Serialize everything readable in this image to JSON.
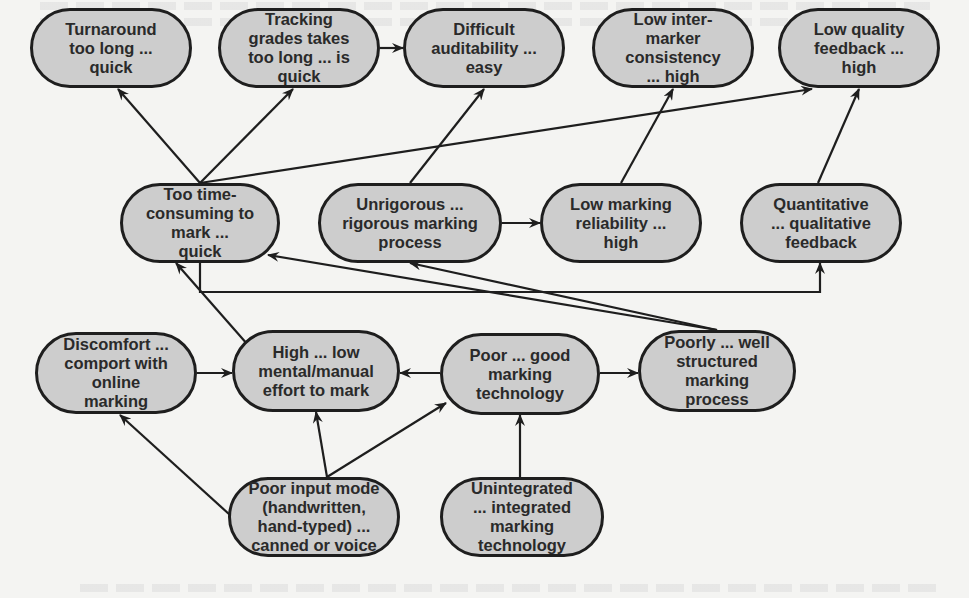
{
  "diagram": {
    "type": "causal-map",
    "colors": {
      "node_fill": "#cdcdcd",
      "node_border": "#1e1e1e",
      "edge": "#1e1e1e",
      "background": "#f4f4f2"
    },
    "nodes": [
      {
        "id": "turnaround",
        "label": "Turnaround\ntoo long ...\nquick",
        "x": 30,
        "y": 8,
        "w": 162,
        "h": 80
      },
      {
        "id": "tracking",
        "label": "Tracking\ngrades takes\ntoo long ...  is\nquick",
        "x": 218,
        "y": 8,
        "w": 162,
        "h": 80
      },
      {
        "id": "auditability",
        "label": "Difficult\nauditability ...\neasy",
        "x": 403,
        "y": 8,
        "w": 162,
        "h": 80
      },
      {
        "id": "consistency",
        "label": "Low inter-\nmarker\nconsistency\n... high",
        "x": 592,
        "y": 8,
        "w": 162,
        "h": 80
      },
      {
        "id": "quality",
        "label": "Low quality\nfeedback ...\nhigh",
        "x": 778,
        "y": 8,
        "w": 162,
        "h": 80
      },
      {
        "id": "timeconsuming",
        "label": "Too time-\nconsuming to\nmark ...\nquick",
        "x": 120,
        "y": 183,
        "w": 160,
        "h": 80
      },
      {
        "id": "unrigorous",
        "label": "Unrigorous ...\nrigorous marking\nprocess",
        "x": 318,
        "y": 183,
        "w": 184,
        "h": 80
      },
      {
        "id": "reliability",
        "label": "Low marking\nreliability ...\nhigh",
        "x": 540,
        "y": 183,
        "w": 162,
        "h": 80
      },
      {
        "id": "quantitative",
        "label": "Quantitative\n... qualitative\nfeedback",
        "x": 740,
        "y": 183,
        "w": 162,
        "h": 80
      },
      {
        "id": "discomfort",
        "label": "Discomfort ...\ncomport with\nonline\nmarking",
        "x": 35,
        "y": 332,
        "w": 162,
        "h": 82
      },
      {
        "id": "effort",
        "label": "High ... low\nmental/manual\neffort to mark",
        "x": 232,
        "y": 330,
        "w": 168,
        "h": 82
      },
      {
        "id": "technology",
        "label": "Poor ... good\nmarking\ntechnology",
        "x": 440,
        "y": 333,
        "w": 160,
        "h": 82
      },
      {
        "id": "structured",
        "label": "Poorly ... well\nstructured\nmarking\nprocess",
        "x": 638,
        "y": 330,
        "w": 158,
        "h": 82
      },
      {
        "id": "inputmode",
        "label": "Poor input mode\n(handwritten,\nhand-typed) ...\ncanned or voice",
        "x": 228,
        "y": 477,
        "w": 172,
        "h": 80
      },
      {
        "id": "unintegrated",
        "label": "Unintegrated\n... integrated\nmarking\ntechnology",
        "x": 440,
        "y": 477,
        "w": 164,
        "h": 80
      }
    ],
    "edges": [
      {
        "from": "timeconsuming",
        "to": "turnaround",
        "points": [
          [
            200,
            183
          ],
          [
            118,
            89
          ]
        ]
      },
      {
        "from": "timeconsuming",
        "to": "tracking",
        "points": [
          [
            200,
            183
          ],
          [
            293,
            89
          ]
        ]
      },
      {
        "from": "timeconsuming",
        "to": "quality",
        "points": [
          [
            200,
            183
          ],
          [
            812,
            89
          ]
        ]
      },
      {
        "from": "tracking",
        "to": "auditability",
        "points": [
          [
            380,
            48
          ],
          [
            403,
            48
          ]
        ]
      },
      {
        "from": "unrigorous",
        "to": "auditability",
        "points": [
          [
            410,
            183
          ],
          [
            484,
            89
          ]
        ]
      },
      {
        "from": "unrigorous",
        "to": "reliability",
        "points": [
          [
            502,
            223
          ],
          [
            540,
            223
          ]
        ]
      },
      {
        "from": "reliability",
        "to": "consistency",
        "points": [
          [
            621,
            183
          ],
          [
            673,
            89
          ]
        ]
      },
      {
        "from": "quantitative",
        "to": "quality",
        "points": [
          [
            818,
            183
          ],
          [
            859,
            89
          ]
        ]
      },
      {
        "from": "timeconsuming",
        "to": "quantitative",
        "points": [
          [
            200,
            263
          ],
          [
            200,
            292
          ],
          [
            820,
            292
          ],
          [
            820,
            263
          ]
        ]
      },
      {
        "from": "structured",
        "to": "timeconsuming",
        "points": [
          [
            717,
            330
          ],
          [
            268,
            255
          ]
        ]
      },
      {
        "from": "structured",
        "to": "unrigorous",
        "points": [
          [
            717,
            330
          ],
          [
            410,
            263
          ]
        ]
      },
      {
        "from": "effort",
        "to": "timeconsuming",
        "points": [
          [
            248,
            345
          ],
          [
            176,
            263
          ]
        ]
      },
      {
        "from": "discomfort",
        "to": "effort",
        "points": [
          [
            197,
            373
          ],
          [
            232,
            373
          ]
        ]
      },
      {
        "from": "technology",
        "to": "effort",
        "points": [
          [
            440,
            373
          ],
          [
            400,
            373
          ]
        ]
      },
      {
        "from": "technology",
        "to": "structured",
        "points": [
          [
            600,
            373
          ],
          [
            638,
            373
          ]
        ]
      },
      {
        "from": "inputmode",
        "to": "discomfort",
        "points": [
          [
            230,
            515
          ],
          [
            120,
            415
          ]
        ]
      },
      {
        "from": "inputmode",
        "to": "effort",
        "points": [
          [
            327,
            477
          ],
          [
            316,
            412
          ]
        ]
      },
      {
        "from": "inputmode",
        "to": "technology",
        "points": [
          [
            327,
            477
          ],
          [
            446,
            403
          ]
        ]
      },
      {
        "from": "unintegrated",
        "to": "technology",
        "points": [
          [
            520,
            477
          ],
          [
            520,
            415
          ]
        ]
      }
    ]
  }
}
